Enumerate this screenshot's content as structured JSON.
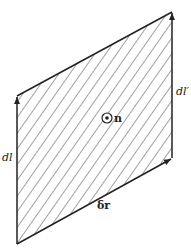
{
  "diagram": {
    "type": "hatched parallelogram with vector edges",
    "labels": {
      "left_edge": "dl",
      "right_edge": "dl′",
      "bottom_edge": "δr",
      "normal": "n"
    },
    "normal_symbol": "⊙",
    "colors": {
      "line": "#222222",
      "hatch": "#444444",
      "background": "#ffffff"
    }
  }
}
